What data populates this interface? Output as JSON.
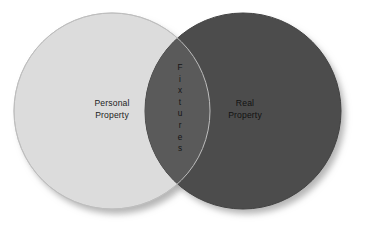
{
  "diagram": {
    "type": "venn",
    "background_color": "#ffffff",
    "width": 366,
    "height": 226,
    "left_set": {
      "name": "personal-property",
      "label_lines": [
        "Personal",
        "Property"
      ],
      "fill_color": "#dcdcdc",
      "stroke_color": "#c4c4c4",
      "center_x": 112,
      "center_y": 111,
      "radius": 98
    },
    "right_set": {
      "name": "real-property",
      "label_lines": [
        "Real",
        "Property"
      ],
      "fill_color": "#4c4c4c",
      "stroke_color": "#3f3f3f",
      "center_x": 243,
      "center_y": 111,
      "radius": 98
    },
    "intersection": {
      "name": "fixtures",
      "label": "Fixtures",
      "label_chars": [
        "F",
        "i",
        "x",
        "t",
        "u",
        "r",
        "e",
        "s"
      ],
      "orientation": "vertical",
      "fill_color": "#5a5a5a",
      "top_vertex_y": 59,
      "bottom_vertex_y": 172
    },
    "shadow": {
      "color": "#b0b0b0",
      "offset_x": 4,
      "offset_y": 5
    },
    "text_color": "#1c1c1c"
  }
}
